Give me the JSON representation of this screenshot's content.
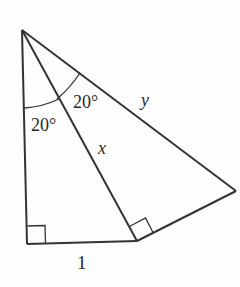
{
  "diagram": {
    "stroke_color": "#333333",
    "background": "#fdfdfd",
    "labels": {
      "angle_lower": "20°",
      "angle_upper": "20°",
      "side_x": "x",
      "side_y": "y",
      "side_base": "1"
    },
    "vertices": {
      "top": [
        22,
        30
      ],
      "bottom_left": [
        27,
        244
      ],
      "bottom_mid": [
        137,
        241
      ],
      "right": [
        236,
        191
      ]
    },
    "right_angles": [
      "bottom_left",
      "bottom_mid"
    ]
  }
}
